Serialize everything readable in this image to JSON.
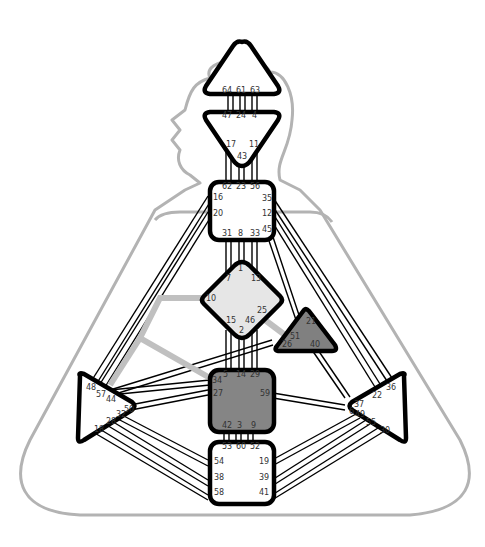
{
  "chart_title": "Human Design Bodygraph",
  "colors": {
    "outline": "#b3b3b3",
    "undefined_center": "#ffffff",
    "g_center": "#e6e6e6",
    "heart_center": "#808080",
    "sacral_center": "#858585",
    "defined_channel": "#c0c0c0",
    "stroke": "#000000"
  },
  "centers": {
    "head": {
      "name": "Head",
      "defined": false,
      "gates": [
        "64",
        "61",
        "63"
      ]
    },
    "ajna": {
      "name": "Ajna",
      "defined": false,
      "gates": [
        "47",
        "24",
        "4",
        "17",
        "43",
        "11"
      ]
    },
    "throat": {
      "name": "Throat",
      "defined": false,
      "gates": [
        "62",
        "23",
        "56",
        "16",
        "35",
        "20",
        "12",
        "45",
        "31",
        "8",
        "33"
      ]
    },
    "g": {
      "name": "G",
      "defined": true,
      "gates": [
        "1",
        "7",
        "13",
        "10",
        "25",
        "15",
        "46",
        "2"
      ]
    },
    "heart": {
      "name": "Heart",
      "defined": true,
      "gates": [
        "21",
        "51",
        "26",
        "40"
      ]
    },
    "sacral": {
      "name": "Sacral",
      "defined": true,
      "gates": [
        "5",
        "14",
        "29",
        "34",
        "27",
        "59",
        "42",
        "3",
        "9"
      ]
    },
    "root": {
      "name": "Root",
      "defined": false,
      "gates": [
        "53",
        "60",
        "52",
        "54",
        "19",
        "38",
        "39",
        "58",
        "41"
      ]
    },
    "spleen": {
      "name": "Spleen",
      "defined": false,
      "gates": [
        "48",
        "57",
        "44",
        "50",
        "32",
        "28",
        "18"
      ]
    },
    "solar_plexus": {
      "name": "Solar Plexus",
      "defined": false,
      "gates": [
        "36",
        "22",
        "37",
        "6",
        "49",
        "55",
        "30"
      ]
    }
  },
  "defined_channels": [
    {
      "gates": "10-57",
      "name": "Perfected Form"
    },
    {
      "gates": "34-57",
      "name": "Power"
    },
    {
      "gates": "25-51",
      "name": "Initiation"
    }
  ]
}
